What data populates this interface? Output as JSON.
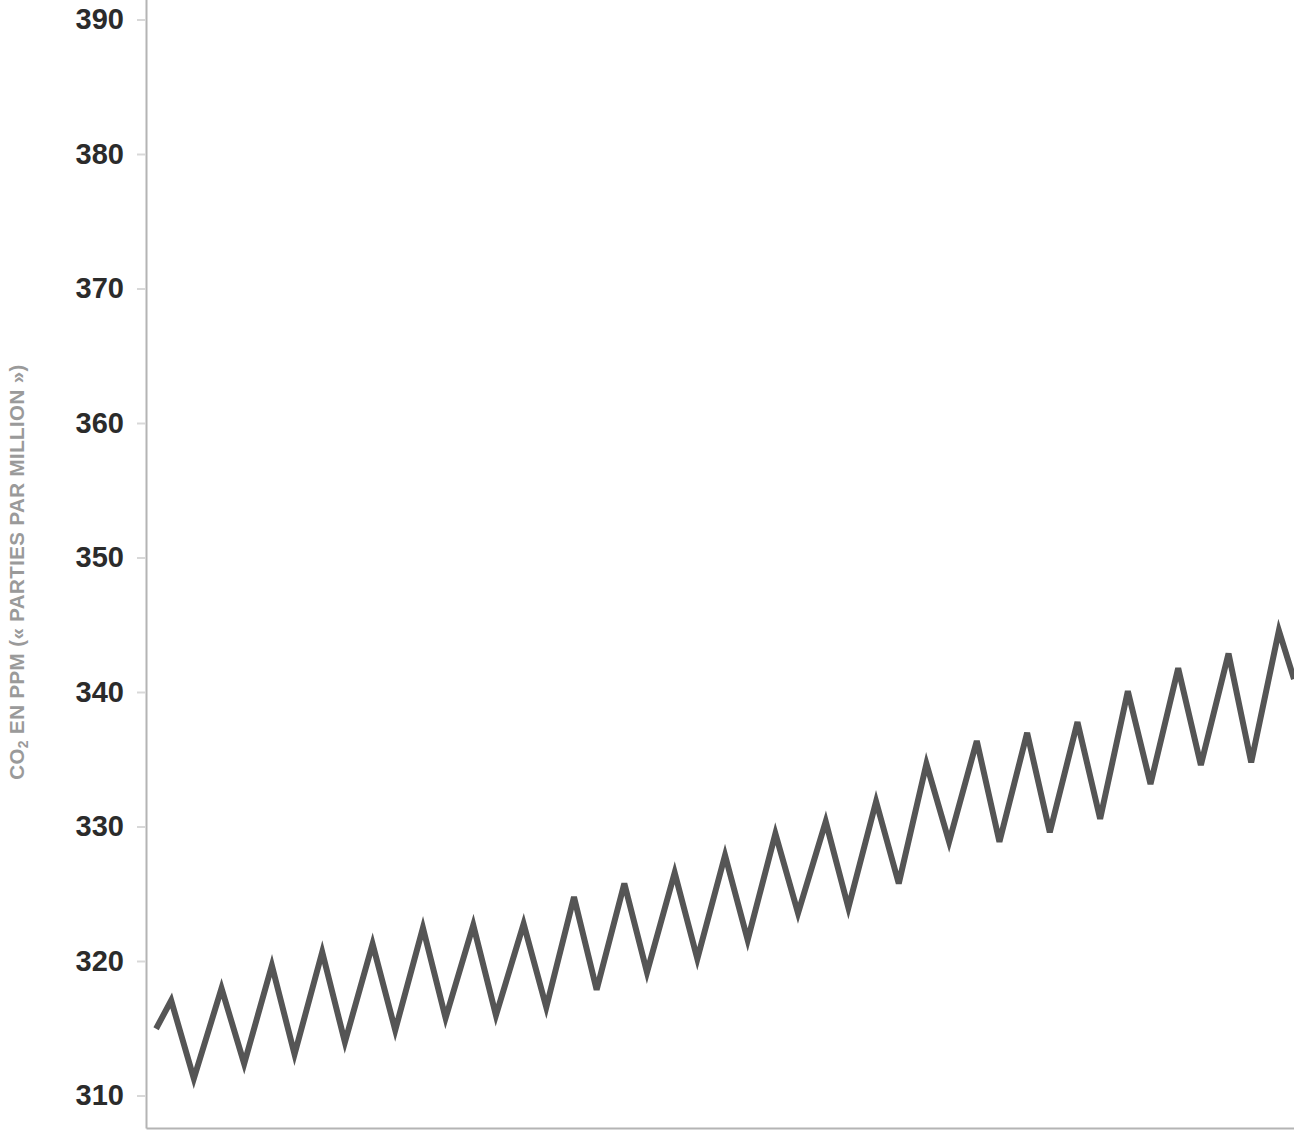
{
  "figure": {
    "background_color": "#ffffff",
    "line_color": "#555555",
    "axis_color": "#b0b0b0",
    "tick_label_color": "#2b2b2b",
    "axis_title_color": "#9a9a9a"
  },
  "axis": {
    "y_title_prefix": "CO",
    "y_title_sub": "2",
    "y_title_suffix": " EN PPM (« PARTIES PAR MILLION »)",
    "y_title_full": "CO2 EN PPM (« PARTIES PAR MILLION »)"
  },
  "chart_data": {
    "type": "line",
    "title": "",
    "subtitle": "",
    "xlabel": "",
    "ylabel": "CO2 EN PPM (« PARTIES PAR MILLION »)",
    "ylim": [
      306.6,
      390.0
    ],
    "xlim": [
      1957.8,
      1980.6
    ],
    "grid": false,
    "legend": null,
    "yticks": [
      310,
      320,
      330,
      340,
      350,
      360,
      370,
      380,
      390
    ],
    "ytick_labels": [
      "310",
      "320",
      "330",
      "340",
      "350",
      "360",
      "370",
      "380",
      "390"
    ],
    "xticks": [],
    "xtick_labels": [],
    "series": [
      {
        "name": "CO2 concentration",
        "color": "#555555",
        "line_width": 6,
        "x": [
          1958.0,
          1958.3,
          1958.75,
          1959.3,
          1959.75,
          1960.3,
          1960.75,
          1961.3,
          1961.75,
          1962.3,
          1962.75,
          1963.3,
          1963.75,
          1964.3,
          1964.75,
          1965.3,
          1965.75,
          1966.3,
          1966.75,
          1967.3,
          1967.75,
          1968.3,
          1968.75,
          1969.3,
          1969.75,
          1970.3,
          1970.75,
          1971.3,
          1971.75,
          1972.3,
          1972.75,
          1973.3,
          1973.75,
          1974.3,
          1974.75,
          1975.3,
          1975.75,
          1976.3,
          1976.75,
          1977.3,
          1977.75,
          1978.3,
          1978.75,
          1979.3,
          1979.75,
          1980.3,
          1980.6
        ],
        "y": [
          315.0,
          317.1,
          311.3,
          318.0,
          312.4,
          319.7,
          313.1,
          320.7,
          314.0,
          321.3,
          314.9,
          322.5,
          315.8,
          322.7,
          316.0,
          322.8,
          316.6,
          324.8,
          317.9,
          325.8,
          319.2,
          326.6,
          320.2,
          327.9,
          321.6,
          329.5,
          323.6,
          330.4,
          324.0,
          331.9,
          325.8,
          334.7,
          328.9,
          336.4,
          328.9,
          337.0,
          329.6,
          337.8,
          330.6,
          340.1,
          333.2,
          341.8,
          334.6,
          342.9,
          334.8,
          344.6,
          341.0
        ],
        "seasonal_amplitude_ppm": 6.0,
        "trend_start_ppm": 315.0,
        "trend_end_ppm": 343.0
      }
    ]
  }
}
